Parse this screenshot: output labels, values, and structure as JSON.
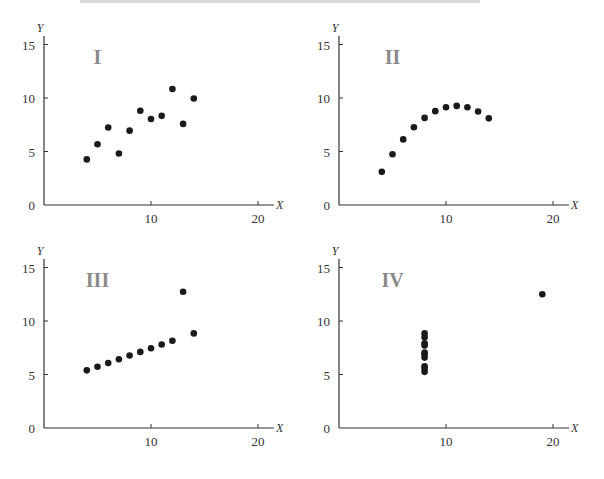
{
  "chart_data": [
    {
      "type": "scatter",
      "title": "I",
      "xlabel": "X",
      "ylabel": "Y",
      "xlim": [
        0,
        21
      ],
      "ylim": [
        0,
        16
      ],
      "xticks": [
        10,
        20
      ],
      "yticks": [
        0,
        5,
        10,
        15
      ],
      "grid": false,
      "x": [
        4,
        5,
        6,
        7,
        8,
        9,
        10,
        11,
        12,
        13,
        14
      ],
      "y": [
        4.26,
        5.68,
        7.24,
        4.82,
        6.95,
        8.81,
        8.04,
        8.33,
        10.84,
        7.58,
        9.96
      ]
    },
    {
      "type": "scatter",
      "title": "II",
      "xlabel": "X",
      "ylabel": "Y",
      "xlim": [
        0,
        21
      ],
      "ylim": [
        0,
        16
      ],
      "xticks": [
        10,
        20
      ],
      "yticks": [
        0,
        5,
        10,
        15
      ],
      "grid": false,
      "x": [
        4,
        5,
        6,
        7,
        8,
        9,
        10,
        11,
        12,
        13,
        14
      ],
      "y": [
        3.1,
        4.74,
        6.13,
        7.26,
        8.14,
        8.77,
        9.14,
        9.26,
        9.13,
        8.74,
        8.1
      ]
    },
    {
      "type": "scatter",
      "title": "III",
      "xlabel": "X",
      "ylabel": "Y",
      "xlim": [
        0,
        21
      ],
      "ylim": [
        0,
        16
      ],
      "xticks": [
        10,
        20
      ],
      "yticks": [
        0,
        5,
        10,
        15
      ],
      "grid": false,
      "x": [
        4,
        5,
        6,
        7,
        8,
        9,
        10,
        11,
        12,
        13,
        14
      ],
      "y": [
        5.39,
        5.73,
        6.08,
        6.42,
        6.77,
        7.11,
        7.46,
        7.81,
        8.15,
        12.74,
        8.84
      ]
    },
    {
      "type": "scatter",
      "title": "IV",
      "xlabel": "X",
      "ylabel": "Y",
      "xlim": [
        0,
        21
      ],
      "ylim": [
        0,
        16
      ],
      "xticks": [
        10,
        20
      ],
      "yticks": [
        0,
        5,
        10,
        15
      ],
      "grid": false,
      "x": [
        8,
        8,
        8,
        8,
        8,
        8,
        8,
        19,
        8,
        8,
        8
      ],
      "y": [
        6.58,
        5.76,
        7.71,
        8.84,
        8.47,
        7.04,
        5.25,
        12.5,
        5.56,
        7.91,
        6.89
      ]
    }
  ],
  "panels": [
    {
      "label": "I",
      "x_axis_name": "X",
      "y_axis_name": "Y",
      "xtick_labels": [
        "10",
        "20"
      ],
      "ytick_labels": [
        "0",
        "5",
        "10",
        "15"
      ]
    },
    {
      "label": "II",
      "x_axis_name": "X",
      "y_axis_name": "Y",
      "xtick_labels": [
        "10",
        "20"
      ],
      "ytick_labels": [
        "0",
        "5",
        "10",
        "15"
      ]
    },
    {
      "label": "III",
      "x_axis_name": "X",
      "y_axis_name": "Y",
      "xtick_labels": [
        "10",
        "20"
      ],
      "ytick_labels": [
        "0",
        "5",
        "10",
        "15"
      ]
    },
    {
      "label": "IV",
      "x_axis_name": "X",
      "y_axis_name": "Y",
      "xtick_labels": [
        "10",
        "20"
      ],
      "ytick_labels": [
        "0",
        "5",
        "10",
        "15"
      ]
    }
  ],
  "colors": {
    "axis": "#333333",
    "point": "#1a1a1a",
    "panel_label": "#8a8a8a"
  }
}
